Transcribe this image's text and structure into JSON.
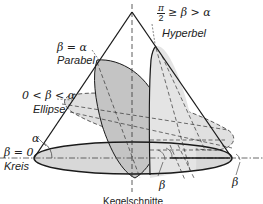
{
  "diagram": {
    "title": "Kegelschnitte",
    "cone_angle_symbol": "α",
    "plane_angle_symbol": "β",
    "sections": [
      {
        "name": "Kreis",
        "condition": "β = 0"
      },
      {
        "name": "Ellipse",
        "condition": "0 < β < α"
      },
      {
        "name": "Parabel",
        "condition": "β = α"
      },
      {
        "name": "Hyperbel",
        "condition_numerator": "π",
        "condition_denominator": "2",
        "condition_rest": "≥ β > α"
      }
    ],
    "angle_markers": [
      "β",
      "β"
    ],
    "colors": {
      "outline": "#1a1a1a",
      "parabola_fill": "#c4c4c4",
      "ellipse_fill": "#dcdcdc",
      "hyperbola_fill": "#e2e2e2",
      "base_fill": "#d6d6d6",
      "background": "#ffffff"
    }
  }
}
